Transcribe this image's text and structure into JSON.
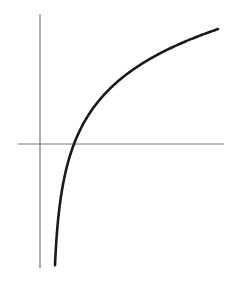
{
  "chart_data": {
    "type": "line",
    "function": "logarithmic",
    "title": "",
    "xlabel": "",
    "ylabel": "",
    "tick_labels": [],
    "legend": [],
    "grid": false,
    "axes": {
      "origin_px": [
        40,
        144
      ],
      "x_axis_px": {
        "x1": 18,
        "x2": 224,
        "y": 144
      },
      "y_axis_px": {
        "x": 40,
        "y1": 14,
        "y2": 268
      }
    },
    "curve_model_px": {
      "form": "y = 144 - k * ln((x - a) / (x0 - a))",
      "a": 52.5,
      "x0": 74,
      "k": 56.3,
      "x_start": 55,
      "x_end": 218
    },
    "annotations": {
      "x_intercept_px": [
        74,
        144
      ],
      "vertical_asymptote_px_x": 52.5,
      "curve_end_px": [
        218,
        29
      ],
      "curve_start_px": [
        55,
        265
      ]
    },
    "colors": {
      "curve": "#1a1a1a",
      "axes": "#777777",
      "background": "#ffffff"
    }
  }
}
